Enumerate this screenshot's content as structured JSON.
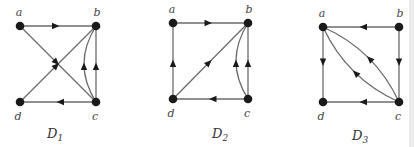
{
  "figure": {
    "graphs": [
      {
        "name": "D",
        "subscript": "1",
        "vertices": [
          {
            "id": "a",
            "label": "a",
            "x": 20,
            "y": 26,
            "lx": 19,
            "ly": 16
          },
          {
            "id": "b",
            "label": "b",
            "x": 96,
            "y": 26,
            "lx": 97,
            "ly": 16
          },
          {
            "id": "c",
            "label": "c",
            "x": 96,
            "y": 102,
            "lx": 95,
            "ly": 120
          },
          {
            "id": "d",
            "label": "d",
            "x": 20,
            "y": 102,
            "lx": 18,
            "ly": 120
          }
        ],
        "edges": [
          {
            "from": "a",
            "to": "b",
            "curve": 0
          },
          {
            "from": "a",
            "to": "c",
            "curve": 0
          },
          {
            "from": "d",
            "to": "b",
            "curve": 0
          },
          {
            "from": "c",
            "to": "d",
            "curve": 0
          },
          {
            "from": "c",
            "to": "b",
            "curve": 0
          },
          {
            "from": "c",
            "to": "b",
            "curve": -12
          }
        ],
        "label_pos": {
          "x": 47,
          "y": 138
        }
      },
      {
        "name": "D",
        "subscript": "2",
        "vertices": [
          {
            "id": "a",
            "label": "a",
            "x": 173,
            "y": 23,
            "lx": 172,
            "ly": 13
          },
          {
            "id": "b",
            "label": "b",
            "x": 248,
            "y": 23,
            "lx": 249,
            "ly": 13
          },
          {
            "id": "c",
            "label": "c",
            "x": 248,
            "y": 99,
            "lx": 247,
            "ly": 117
          },
          {
            "id": "d",
            "label": "d",
            "x": 173,
            "y": 99,
            "lx": 171,
            "ly": 117
          }
        ],
        "edges": [
          {
            "from": "a",
            "to": "b",
            "curve": 0
          },
          {
            "from": "d",
            "to": "a",
            "curve": 0
          },
          {
            "from": "d",
            "to": "b",
            "curve": 0
          },
          {
            "from": "c",
            "to": "d",
            "curve": 0
          },
          {
            "from": "c",
            "to": "b",
            "curve": 0
          },
          {
            "from": "c",
            "to": "b",
            "curve": -12
          }
        ],
        "label_pos": {
          "x": 212,
          "y": 138
        }
      },
      {
        "name": "D",
        "subscript": "3",
        "vertices": [
          {
            "id": "a",
            "label": "a",
            "x": 323,
            "y": 27,
            "lx": 322,
            "ly": 17
          },
          {
            "id": "b",
            "label": "b",
            "x": 399,
            "y": 27,
            "lx": 400,
            "ly": 17
          },
          {
            "id": "c",
            "label": "c",
            "x": 399,
            "y": 102,
            "lx": 398,
            "ly": 120
          },
          {
            "id": "d",
            "label": "d",
            "x": 323,
            "y": 102,
            "lx": 321,
            "ly": 120
          }
        ],
        "edges": [
          {
            "from": "b",
            "to": "a",
            "curve": 0
          },
          {
            "from": "a",
            "to": "d",
            "curve": 0
          },
          {
            "from": "b",
            "to": "c",
            "curve": 0
          },
          {
            "from": "c",
            "to": "d",
            "curve": 0
          },
          {
            "from": "c",
            "to": "a",
            "curve": 10
          },
          {
            "from": "c",
            "to": "a",
            "curve": -10
          }
        ],
        "label_pos": {
          "x": 352,
          "y": 140
        }
      }
    ]
  }
}
